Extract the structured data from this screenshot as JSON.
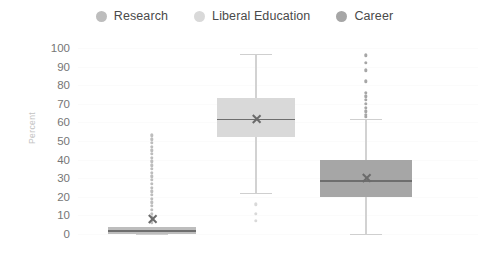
{
  "legend": {
    "items": [
      {
        "label": "Research",
        "color": "#bdbdbd"
      },
      {
        "label": "Liberal Education",
        "color": "#d9d9d9"
      },
      {
        "label": "Career",
        "color": "#a6a6a6"
      }
    ]
  },
  "chart_data": {
    "type": "box",
    "title": "",
    "xlabel": "",
    "ylabel": "Percent",
    "ylim": [
      0,
      100
    ],
    "yticks": [
      100,
      90,
      80,
      70,
      60,
      50,
      40,
      30,
      20,
      10,
      0
    ],
    "ytick_labels": [
      "100",
      "90",
      "80",
      "70",
      "60",
      "50",
      "40",
      "30",
      "20",
      "10",
      "0"
    ],
    "grid": false,
    "legend_position": "top-center",
    "categories": [
      "Research",
      "Liberal Education",
      "Career"
    ],
    "series": [
      {
        "name": "Research",
        "color": "#bdbdbd",
        "q1": 0,
        "median": 2,
        "q3": 4,
        "mean": 8,
        "whisker_low": 0,
        "whisker_high": 4,
        "outliers": [
          53,
          51,
          49,
          47,
          45,
          43,
          41,
          39,
          37,
          35,
          33,
          31,
          29,
          27,
          25,
          23,
          21,
          19,
          17,
          15,
          13,
          11,
          9,
          7,
          6
        ]
      },
      {
        "name": "Liberal Education",
        "color": "#d9d9d9",
        "q1": 52,
        "median": 62,
        "q3": 73,
        "mean": 62,
        "whisker_low": 22,
        "whisker_high": 97,
        "outliers": [
          16,
          11,
          7
        ]
      },
      {
        "name": "Career",
        "color": "#a6a6a6",
        "q1": 20,
        "median": 29,
        "q3": 40,
        "mean": 30,
        "whisker_low": 0,
        "whisker_high": 62,
        "outliers": [
          96,
          92,
          88,
          82,
          76,
          74,
          72,
          70,
          68,
          66,
          64,
          63
        ]
      }
    ]
  }
}
